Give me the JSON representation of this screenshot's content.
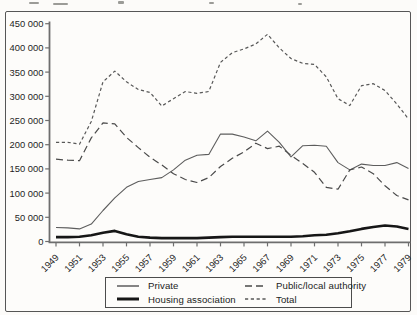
{
  "figure": {
    "frame_color": "#565656",
    "background": "#fdfcfa",
    "line_color_dark": "#161616",
    "line_color_gray": "#565656"
  },
  "chart_data": {
    "type": "line",
    "title": "",
    "xlabel": "",
    "ylabel": "",
    "grid": false,
    "legend_position": "bottom",
    "ylim": [
      0,
      450000
    ],
    "x": [
      1949,
      1950,
      1951,
      1952,
      1953,
      1954,
      1955,
      1956,
      1957,
      1958,
      1959,
      1960,
      1961,
      1962,
      1963,
      1964,
      1965,
      1966,
      1967,
      1968,
      1969,
      1970,
      1971,
      1972,
      1973,
      1974,
      1975,
      1976,
      1977,
      1978,
      1979
    ],
    "x_tick_years": [
      1949,
      1951,
      1953,
      1955,
      1957,
      1959,
      1961,
      1963,
      1965,
      1967,
      1969,
      1971,
      1973,
      1975,
      1977,
      1979
    ],
    "x_tick_labels": [
      "1949",
      "1951",
      "1953",
      "1955",
      "1957",
      "1959",
      "1961",
      "1963",
      "1965",
      "1967",
      "1969",
      "1971",
      "1973",
      "1975",
      "1977",
      "1979"
    ],
    "y_ticks": [
      0,
      50000,
      100000,
      150000,
      200000,
      250000,
      300000,
      350000,
      400000,
      450000
    ],
    "y_tick_labels": [
      "0",
      "50 000",
      "100 000",
      "150 000",
      "200 000",
      "250 000",
      "300 000",
      "350 000",
      "400 000",
      "450 000"
    ],
    "series": [
      {
        "name": "Private",
        "style": "thin-solid",
        "color": "#5d5d5d",
        "width": 1.1,
        "dash": "",
        "values": [
          29000,
          28000,
          26000,
          36000,
          64000,
          90000,
          112000,
          124000,
          128000,
          132000,
          148000,
          168000,
          178000,
          180000,
          222000,
          222000,
          216000,
          208000,
          228000,
          205000,
          175000,
          198000,
          199000,
          197000,
          163000,
          148000,
          160000,
          157000,
          157000,
          163000,
          151000
        ]
      },
      {
        "name": "Housing association",
        "style": "thick-solid",
        "color": "#161616",
        "width": 2.6,
        "dash": "",
        "values": [
          9000,
          9000,
          10000,
          13000,
          18000,
          22000,
          15000,
          10000,
          8000,
          7000,
          7000,
          7000,
          7000,
          8000,
          9000,
          10000,
          10000,
          10000,
          10000,
          10000,
          10000,
          11000,
          13000,
          14000,
          17000,
          21000,
          26000,
          30000,
          33000,
          31000,
          26000
        ]
      },
      {
        "name": "Public/local authority",
        "style": "dashed",
        "color": "#4a4a4a",
        "width": 1.2,
        "dash": "7 4",
        "values": [
          170000,
          168000,
          167000,
          214000,
          245000,
          243000,
          215000,
          194000,
          174000,
          158000,
          140000,
          128000,
          122000,
          132000,
          155000,
          172000,
          185000,
          203000,
          192000,
          197000,
          178000,
          161000,
          143000,
          112000,
          108000,
          148000,
          154000,
          140000,
          115000,
          95000,
          86000
        ]
      },
      {
        "name": "Total",
        "style": "fine-dashed",
        "color": "#585858",
        "width": 1.2,
        "dash": "3.2 2.6",
        "values": [
          205000,
          205000,
          201000,
          248000,
          330000,
          352000,
          330000,
          314000,
          308000,
          280000,
          295000,
          310000,
          306000,
          310000,
          370000,
          390000,
          398000,
          408000,
          428000,
          400000,
          378000,
          368000,
          366000,
          340000,
          295000,
          281000,
          322000,
          326000,
          312000,
          284000,
          253000
        ]
      }
    ]
  }
}
